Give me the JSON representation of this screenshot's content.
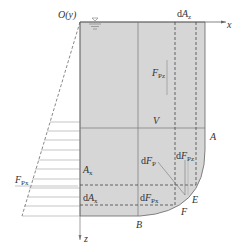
{
  "diagram": {
    "colors": {
      "fluid": "#d6d6d6",
      "lines": "#555555",
      "dashed": "#444444",
      "text": "#333333"
    },
    "labels": {
      "origin": "O(y)",
      "x_axis": "x",
      "z_axis": "z",
      "dAz_prefix": "d",
      "dAz_main": "A",
      "dAz_sub": "z",
      "Fpz_main": "F",
      "Fpz_sub": "Pz",
      "V": "V",
      "A": "A",
      "Ax_main": "A",
      "Ax_sub": "x",
      "Fpx_main": "F",
      "Fpx_sub": "Px",
      "dFp_prefix": "d",
      "dFp_main": "F",
      "dFp_sub": "P",
      "dFpz_prefix": "d",
      "dFpz_main": "F",
      "dFpz_sub": "Pz",
      "dAx_prefix": "d",
      "dAx_main": "A",
      "dAx_sub": "x",
      "dFpx_prefix": "d",
      "dFpx_main": "F",
      "dFpx_sub": "Px",
      "E": "E",
      "F": "F",
      "B": "B"
    }
  }
}
